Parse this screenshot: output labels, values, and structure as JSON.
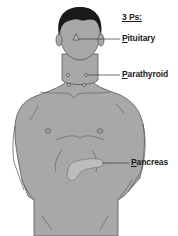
{
  "diagram": {
    "title": "3 Ps:",
    "labels": [
      {
        "id": "pituitary",
        "first": "P",
        "rest": "ituitary",
        "text": "Pituitary"
      },
      {
        "id": "parathyroid",
        "first": "P",
        "rest": "arathyroid",
        "text": "Parathyroid"
      },
      {
        "id": "pancreas",
        "first": "P",
        "rest": "ancreas",
        "text": "Pancreas"
      }
    ],
    "colors": {
      "body_fill": "#a8a8a8",
      "outline": "#555555",
      "hair": "#1a1a1a",
      "leader_line": "#333333",
      "gland_fill": "#bdbdbd",
      "text": "#1a1a1a"
    }
  }
}
